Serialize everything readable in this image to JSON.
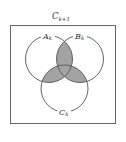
{
  "diagram": {
    "type": "venn",
    "universe": {
      "label": "C",
      "subscript": "k+1",
      "box": {
        "x": 10,
        "y": 25,
        "width": 106,
        "height": 99
      }
    },
    "sets": [
      {
        "label": "A",
        "subscript": "k",
        "cx": 49,
        "cy": 59,
        "r": 23.5
      },
      {
        "label": "B",
        "subscript": "k",
        "cx": 80,
        "cy": 59,
        "r": 23.5
      },
      {
        "label": "C",
        "subscript": "k",
        "cx": 64.5,
        "cy": 88.5,
        "r": 23.5
      }
    ],
    "shaded_regions": [
      "A∩B",
      "A∩C",
      "B∩C"
    ],
    "colors": {
      "stroke": "#555555",
      "shade": "#9e9e9e",
      "background": "#ffffff"
    }
  }
}
